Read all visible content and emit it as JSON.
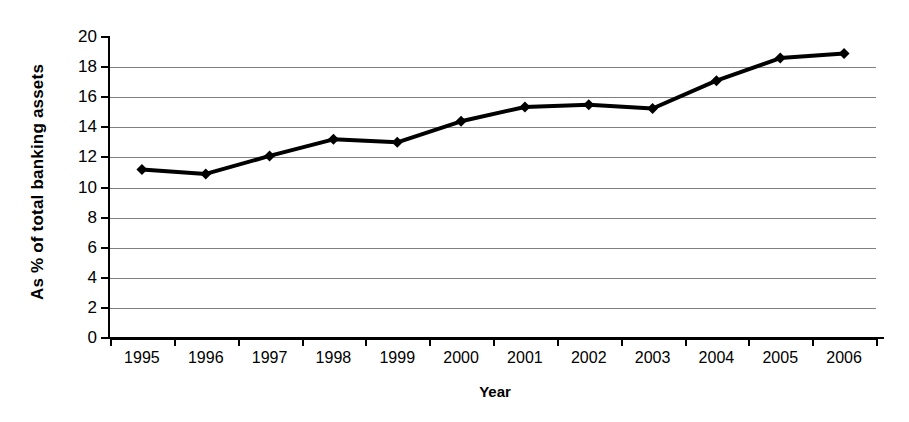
{
  "chart_data": {
    "type": "line",
    "title": "",
    "xlabel": "Year",
    "ylabel": "As % of total banking assets",
    "categories": [
      "1995",
      "1996",
      "1997",
      "1998",
      "1999",
      "2000",
      "2001",
      "2002",
      "2003",
      "2004",
      "2005",
      "2006"
    ],
    "values": [
      11.2,
      10.9,
      12.1,
      13.2,
      13.0,
      14.4,
      15.35,
      15.5,
      15.25,
      17.1,
      18.6,
      18.9
    ],
    "series": [
      {
        "name": "As % of total banking assets",
        "values": [
          11.2,
          10.9,
          12.1,
          13.2,
          13.0,
          14.4,
          15.35,
          15.5,
          15.25,
          17.1,
          18.6,
          18.9
        ]
      }
    ],
    "ylim": [
      0,
      20
    ],
    "ytick_step": 2,
    "yticks": [
      "20",
      "18",
      "16",
      "14",
      "12",
      "10",
      "8",
      "6",
      "4",
      "2",
      "0"
    ],
    "grid": "horizontal",
    "legend": "none",
    "marker": "diamond",
    "line_color": "#000000",
    "marker_color": "#000000",
    "grid_color": "#808080",
    "axis_color": "#000000",
    "background": "#ffffff"
  }
}
